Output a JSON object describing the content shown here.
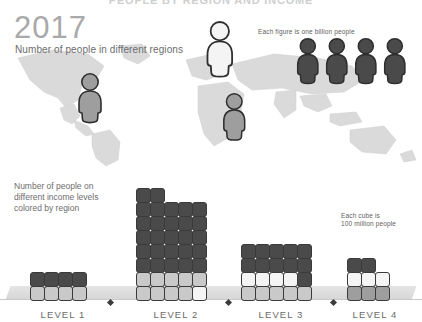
{
  "header": {
    "clipped_title": "PEOPLE BY REGION AND INCOME",
    "year": "2017",
    "subtitle": "Number of people in different regions"
  },
  "legends": {
    "figure_legend": "Each figure is one billion people",
    "cube_legend_line1": "Each cube is",
    "cube_legend_line2": "100 million people"
  },
  "income_section": {
    "label_line1": "Number of people on",
    "label_line2": "different income levels",
    "label_line3": "colored by region"
  },
  "colors": {
    "dark": "#4a4a4a",
    "mid": "#9e9e9e",
    "light": "#c9c9c9",
    "white": "#f4f4f4",
    "outline": "#3a3a3a",
    "map_land": "#d9d9d9",
    "text": "#6d6d6d",
    "year_text": "#a9a9a9"
  },
  "map_figures": [
    {
      "name": "figure-americas",
      "shade": "mid",
      "left": 75,
      "top": 72,
      "scale": 1.0
    },
    {
      "name": "figure-europe",
      "shade": "white",
      "left": 203,
      "top": 20,
      "scale": 1.12
    },
    {
      "name": "figure-africa",
      "shade": "mid",
      "left": 220,
      "top": 92,
      "scale": 0.95
    }
  ],
  "legend_figures": [
    {
      "name": "legend-figure-1",
      "shade": "dark"
    },
    {
      "name": "legend-figure-2",
      "shade": "dark"
    },
    {
      "name": "legend-figure-3",
      "shade": "dark"
    },
    {
      "name": "legend-figure-4",
      "shade": "dark"
    }
  ],
  "levels": [
    {
      "label": "LEVEL 1",
      "left": 30,
      "width": 66
    },
    {
      "label": "LEVEL 2",
      "left": 136,
      "width": 80
    },
    {
      "label": "LEVEL 3",
      "left": 241,
      "width": 80
    },
    {
      "label": "LEVEL 4",
      "left": 347,
      "width": 56
    }
  ],
  "chart_data": {
    "type": "bar",
    "title": "Number of people on different income levels colored by region",
    "unit_note": "Each cube is 100 million people",
    "xlabel": "",
    "ylabel": "Number of people (100 million per cube)",
    "categories": [
      "LEVEL 1",
      "LEVEL 2",
      "LEVEL 3",
      "LEVEL 4"
    ],
    "values": [
      8,
      38,
      20,
      8
    ],
    "columns_per_level": [
      4,
      5,
      5,
      3
    ],
    "stacks": [
      {
        "level": "LEVEL 1",
        "columns": [
          [
            "light",
            "dark"
          ],
          [
            "light",
            "dark"
          ],
          [
            "light",
            "dark"
          ],
          [
            "light",
            "dark"
          ]
        ]
      },
      {
        "level": "LEVEL 2",
        "columns": [
          [
            "light",
            "light",
            "dark",
            "dark",
            "dark",
            "dark",
            "dark",
            "dark"
          ],
          [
            "light",
            "light",
            "dark",
            "dark",
            "dark",
            "dark",
            "dark",
            "dark"
          ],
          [
            "light",
            "light",
            "dark",
            "dark",
            "dark",
            "dark",
            "dark"
          ],
          [
            "light",
            "light",
            "dark",
            "dark",
            "dark",
            "dark",
            "dark"
          ],
          [
            "white",
            "light",
            "dark",
            "dark",
            "dark",
            "dark",
            "dark"
          ]
        ]
      },
      {
        "level": "LEVEL 3",
        "columns": [
          [
            "light",
            "white",
            "dark",
            "dark"
          ],
          [
            "light",
            "white",
            "dark",
            "dark"
          ],
          [
            "light",
            "white",
            "dark",
            "dark"
          ],
          [
            "light",
            "white",
            "dark",
            "dark"
          ],
          [
            "light",
            "dark",
            "dark",
            "dark"
          ]
        ]
      },
      {
        "level": "LEVEL 4",
        "columns": [
          [
            "mid",
            "white",
            "dark"
          ],
          [
            "mid",
            "white",
            "dark"
          ],
          [
            "mid",
            "white"
          ]
        ]
      }
    ],
    "separators": [
      {
        "name": "separator-1",
        "left": 108
      },
      {
        "name": "separator-2",
        "left": 226
      },
      {
        "name": "separator-3",
        "left": 331
      }
    ]
  }
}
